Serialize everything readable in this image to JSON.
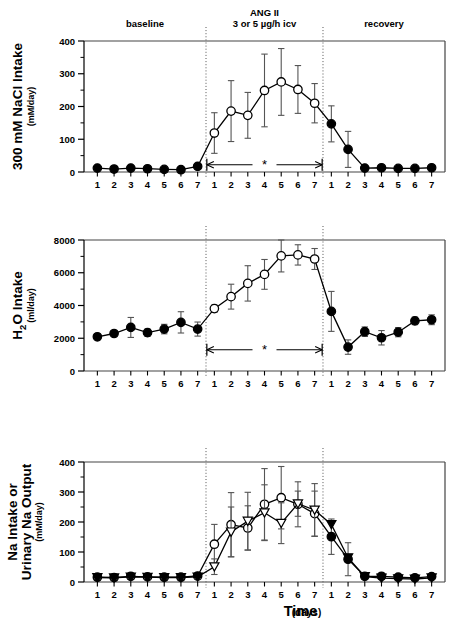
{
  "figure": {
    "header": {
      "baseline_label": "baseline",
      "treatment_label_line1": "ANG II",
      "treatment_label_line2": "3 or 5 µg/h icv",
      "recovery_label": "recovery"
    },
    "x_axis_title_main": "Time",
    "x_axis_title_sub": "(days)",
    "significance_marker": "*"
  },
  "chart_data": [
    {
      "type": "line",
      "panel": "top",
      "title": "300 mM NaCl Intake",
      "ylabel": "300 mM NaCl Intake",
      "ylabel_units": "(mM/day)",
      "xlabel": "Time (days)",
      "ylim": [
        0,
        400
      ],
      "yticks": [
        0,
        100,
        200,
        300,
        400
      ],
      "yticklabels": [
        "0",
        "100",
        "200",
        "300",
        "400"
      ],
      "yminor_step": 50,
      "grid": false,
      "legend": "none",
      "phases": [
        "baseline",
        "ANG II",
        "recovery"
      ],
      "x": [
        1,
        2,
        3,
        4,
        5,
        6,
        7,
        1,
        2,
        3,
        4,
        5,
        6,
        7,
        1,
        2,
        3,
        4,
        5,
        6,
        7
      ],
      "xticklabels": [
        "1",
        "2",
        "3",
        "4",
        "5",
        "6",
        "7",
        "1",
        "2",
        "3",
        "4",
        "5",
        "6",
        "7",
        "1",
        "2",
        "3",
        "4",
        "5",
        "6",
        "7"
      ],
      "series": [
        {
          "name": "300 mM NaCl intake",
          "marker": "mixed-filled-open",
          "values": [
            12,
            9,
            12,
            10,
            8,
            7,
            17,
            119,
            186,
            173,
            249,
            275,
            252,
            210,
            147,
            69,
            12,
            13,
            11,
            11,
            13
          ],
          "errors": [
            4,
            4,
            4,
            4,
            4,
            4,
            6,
            62,
            93,
            70,
            111,
            102,
            73,
            60,
            55,
            55,
            4,
            4,
            4,
            4,
            4
          ],
          "fills": [
            "filled",
            "filled",
            "filled",
            "filled",
            "filled",
            "filled",
            "filled",
            "open",
            "open",
            "open",
            "open",
            "open",
            "open",
            "open",
            "filled",
            "filled",
            "filled",
            "filled",
            "filled",
            "filled",
            "filled"
          ]
        }
      ],
      "sig_bar": {
        "from_index": 7,
        "to_index": 13,
        "y": 22,
        "label": "*"
      }
    },
    {
      "type": "line",
      "panel": "middle",
      "title": "H2O Intake",
      "ylabel_main": "H",
      "ylabel_sub": "2",
      "ylabel_rest": "O Intake",
      "ylabel_units": "(ml/day)",
      "xlabel": "Time (days)",
      "ylim": [
        0,
        8000
      ],
      "yticks": [
        0,
        2000,
        4000,
        6000,
        8000
      ],
      "yticklabels": [
        "0",
        "2000",
        "4000",
        "6000",
        "8000"
      ],
      "yminor_step": 1000,
      "grid": false,
      "legend": "none",
      "phases": [
        "baseline",
        "ANG II",
        "recovery"
      ],
      "x": [
        1,
        2,
        3,
        4,
        5,
        6,
        7,
        1,
        2,
        3,
        4,
        5,
        6,
        7,
        1,
        2,
        3,
        4,
        5,
        6,
        7
      ],
      "xticklabels": [
        "1",
        "2",
        "3",
        "4",
        "5",
        "6",
        "7",
        "1",
        "2",
        "3",
        "4",
        "5",
        "6",
        "7",
        "1",
        "2",
        "3",
        "4",
        "5",
        "6",
        "7"
      ],
      "series": [
        {
          "name": "H2O intake",
          "marker": "mixed-filled-open",
          "values": [
            2090,
            2290,
            2660,
            2340,
            2560,
            2970,
            2560,
            3810,
            4540,
            5350,
            5900,
            7030,
            7090,
            6840,
            3640,
            1460,
            2400,
            2030,
            2370,
            3060,
            3130
          ],
          "errors": [
            160,
            140,
            610,
            220,
            290,
            650,
            430,
            220,
            760,
            1080,
            910,
            980,
            620,
            640,
            1220,
            440,
            290,
            440,
            280,
            230,
            300
          ],
          "fills": [
            "filled",
            "filled",
            "filled",
            "filled",
            "filled",
            "filled",
            "filled",
            "open",
            "open",
            "open",
            "open",
            "open",
            "open",
            "open",
            "filled",
            "filled",
            "filled",
            "filled",
            "filled",
            "filled",
            "filled"
          ]
        }
      ],
      "sig_bar": {
        "from_index": 7,
        "to_index": 13,
        "y": 1300,
        "label": "*"
      }
    },
    {
      "type": "line",
      "panel": "bottom",
      "title": "Na Intake or Urinary Na Output",
      "ylabel_line1": "Na Intake or",
      "ylabel_line2": "Urinary Na Output",
      "ylabel_units": "(mM/day)",
      "xlabel": "Time (days)",
      "ylim": [
        0,
        400
      ],
      "yticks": [
        0,
        100,
        200,
        300,
        400
      ],
      "yticklabels": [
        "0",
        "100",
        "200",
        "300",
        "400"
      ],
      "yminor_step": 50,
      "grid": false,
      "legend": "none",
      "phases": [
        "baseline",
        "ANG II",
        "recovery"
      ],
      "x": [
        1,
        2,
        3,
        4,
        5,
        6,
        7,
        1,
        2,
        3,
        4,
        5,
        6,
        7,
        1,
        2,
        3,
        4,
        5,
        6,
        7
      ],
      "xticklabels": [
        "1",
        "2",
        "3",
        "4",
        "5",
        "6",
        "7",
        "1",
        "2",
        "3",
        "4",
        "5",
        "6",
        "7",
        "1",
        "2",
        "3",
        "4",
        "5",
        "6",
        "7"
      ],
      "series": [
        {
          "name": "Na intake",
          "marker": "circle",
          "values": [
            16,
            15,
            19,
            17,
            16,
            16,
            20,
            126,
            191,
            180,
            259,
            281,
            259,
            228,
            151,
            76,
            19,
            19,
            16,
            14,
            18
          ],
          "errors": [
            5,
            5,
            5,
            5,
            5,
            5,
            8,
            66,
            107,
            74,
            119,
            104,
            75,
            75,
            59,
            55,
            5,
            5,
            5,
            5,
            5
          ],
          "fills": [
            "filled",
            "filled",
            "filled",
            "filled",
            "filled",
            "filled",
            "filled",
            "open",
            "open",
            "open",
            "open",
            "open",
            "open",
            "open",
            "filled",
            "filled",
            "filled",
            "filled",
            "filled",
            "filled",
            "filled"
          ]
        },
        {
          "name": "Urinary Na output",
          "marker": "triangle-down",
          "values": [
            15,
            14,
            17,
            16,
            15,
            15,
            17,
            51,
            167,
            203,
            231,
            196,
            261,
            240,
            192,
            81,
            18,
            13,
            11,
            10,
            14
          ],
          "errors": [
            4,
            4,
            4,
            4,
            4,
            4,
            6,
            26,
            83,
            96,
            93,
            68,
            42,
            88,
            0,
            0,
            0,
            0,
            0,
            0,
            0
          ],
          "fills": [
            "filled",
            "filled",
            "filled",
            "filled",
            "filled",
            "filled",
            "filled",
            "open",
            "open",
            "open",
            "open",
            "open",
            "open",
            "open",
            "filled",
            "filled",
            "filled",
            "filled",
            "filled",
            "filled",
            "filled"
          ]
        }
      ]
    }
  ]
}
